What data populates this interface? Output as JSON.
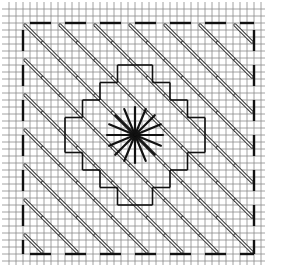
{
  "diagram": {
    "colors": {
      "grid": "#8a8a8a",
      "stitch": "#111111",
      "background": "#ffffff"
    },
    "grid": {
      "origin": 9,
      "step": 7,
      "count": 37
    },
    "border": {
      "from": 2,
      "to": 35
    },
    "center": {
      "col": 18,
      "row": 18
    },
    "elements": [
      "canvas-grid",
      "dashed-border",
      "diagonal-satin-stitches",
      "stepped-cross-outline",
      "center-star-eyelet"
    ]
  }
}
